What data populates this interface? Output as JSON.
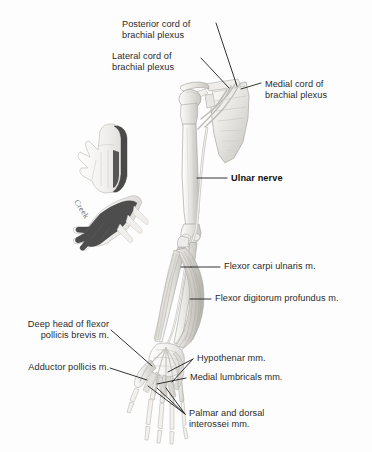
{
  "figure": {
    "subject": "Ulnar nerve",
    "background_color": "#fdfdfd",
    "label_color": "#2b2b2b",
    "leader_color": "#1d1d1d",
    "shade_color": "#4a4a4a",
    "signature": "Creek"
  },
  "labels": {
    "posterior_cord": "Posterior cord of\nbrachial plexus",
    "lateral_cord": "Lateral cord of\nbrachial plexus",
    "medial_cord": "Medial cord of\nbrachial plexus",
    "ulnar_nerve": "Ulnar nerve",
    "flexor_carpi_ulnaris": "Flexor carpi ulnaris m.",
    "flexor_digitorum_profundus": "Flexor digitorum profundus m.",
    "deep_head_fpb": "Deep head of flexor\npollicis brevis m.",
    "adductor_pollicis": "Adductor pollicis m.",
    "hypothenar": "Hypothenar mm.",
    "medial_lumbricals": "Medial lumbricals mm.",
    "interossei": "Palmar and dorsal\ninterossei mm."
  },
  "insets": {
    "palmar_hand": "palmar-hand-sensory-inset",
    "dorsal_hand": "dorsal-hand-sensory-inset"
  },
  "anatomy": {
    "scapula": "scapula",
    "clavicle": "clavicle",
    "humerus": "humerus",
    "radius": "radius",
    "ulna": "ulna",
    "hand_skeleton": "hand-skeleton",
    "nerve_trunk": "ulnar-nerve-trunk"
  }
}
